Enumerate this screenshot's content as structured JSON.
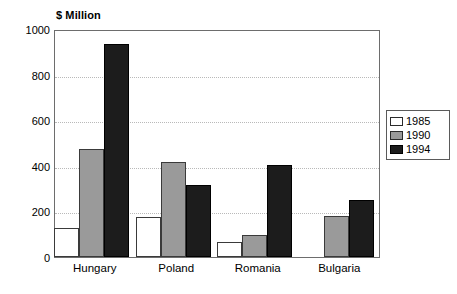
{
  "chart_data": {
    "type": "bar",
    "title": "$ Million",
    "xlabel": "",
    "ylabel": "$ Million",
    "ylim": [
      0,
      1000
    ],
    "yticks": [
      0,
      200,
      400,
      600,
      800,
      1000
    ],
    "grid": true,
    "legend_position": "right",
    "categories": [
      "Hungary",
      "Poland",
      "Romania",
      "Bulgaria"
    ],
    "series": [
      {
        "name": "1985",
        "color": "#ffffff",
        "values": [
          127,
          175,
          65,
          0
        ]
      },
      {
        "name": "1990",
        "color": "#9a9a9a",
        "values": [
          475,
          418,
          97,
          180
        ]
      },
      {
        "name": "1994",
        "color": "#1c1c1c",
        "values": [
          935,
          315,
          405,
          248
        ]
      }
    ]
  },
  "axis": {
    "y_tick_labels": [
      "1000",
      "800",
      "600",
      "400",
      "200",
      "0"
    ],
    "x_tick_labels": [
      "Hungary",
      "Poland",
      "Romania",
      "Bulgaria"
    ]
  },
  "legend": {
    "entries": [
      {
        "label": "1985"
      },
      {
        "label": "1990"
      },
      {
        "label": "1994"
      }
    ]
  }
}
